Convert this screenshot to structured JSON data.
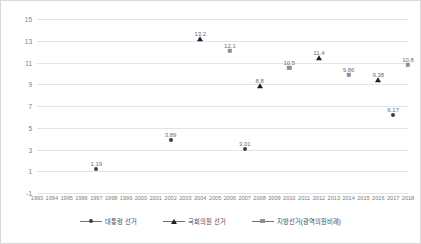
{
  "chart_data": {
    "type": "scatter",
    "title": "",
    "xlabel": "",
    "ylabel": "",
    "grid": true,
    "legend_position": "bottom",
    "xlim": [
      1993,
      2018
    ],
    "ylim": [
      -1,
      15
    ],
    "yticks": [
      "15",
      "13",
      "11",
      "9",
      "7",
      "5",
      "3",
      "1",
      "-1"
    ],
    "ytick_values": [
      15,
      13,
      11,
      9,
      7,
      5,
      3,
      1,
      -1
    ],
    "xticks": [
      "1993",
      "1994",
      "1995",
      "1996",
      "1997",
      "1998",
      "1999",
      "2000",
      "2001",
      "2002",
      "2003",
      "2004",
      "2005",
      "2006",
      "2007",
      "2008",
      "2009",
      "2010",
      "2011",
      "2012",
      "2013",
      "2014",
      "2015",
      "2016",
      "2017",
      "2018"
    ],
    "series": [
      {
        "name": "대통령 선거",
        "marker": "circle",
        "color": "#3c3c50",
        "points": [
          {
            "x": 1997,
            "y": 1.19,
            "label": "1.19"
          },
          {
            "x": 2002,
            "y": 3.89,
            "label": "3.89"
          },
          {
            "x": 2007,
            "y": 3.01,
            "label": "3.01"
          },
          {
            "x": 2017,
            "y": 6.17,
            "label": "6.17"
          }
        ]
      },
      {
        "name": "국회의원 선거",
        "marker": "triangle",
        "color": "#1d1d28",
        "points": [
          {
            "x": 2004,
            "y": 13.2,
            "label": "13.2"
          },
          {
            "x": 2008,
            "y": 8.8,
            "label": "8.8"
          },
          {
            "x": 2012,
            "y": 11.4,
            "label": "11.4"
          },
          {
            "x": 2016,
            "y": 9.38,
            "label": "9.38"
          }
        ]
      },
      {
        "name": "지방선거(광역의원비례)",
        "marker": "square",
        "color": "#8e8e9c",
        "points": [
          {
            "x": 2006,
            "y": 12.1,
            "label": "12.1"
          },
          {
            "x": 2010,
            "y": 10.5,
            "label": "10.5"
          },
          {
            "x": 2014,
            "y": 9.86,
            "label": "9.86"
          },
          {
            "x": 2018,
            "y": 10.8,
            "label": "10.8"
          }
        ]
      }
    ]
  },
  "legend": {
    "items": [
      {
        "label": "대통령 선거",
        "marker": "circle"
      },
      {
        "label": "국회의원 선거",
        "marker": "triangle"
      },
      {
        "label": "지방선거(광역의원비례)",
        "marker": "square"
      }
    ]
  }
}
